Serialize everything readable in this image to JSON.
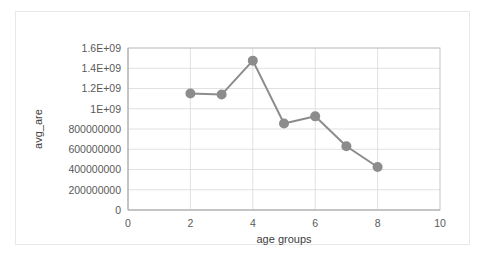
{
  "chart_data": {
    "type": "line",
    "title": "",
    "xlabel": "age groups",
    "ylabel": "avg_are",
    "x": [
      2,
      3,
      4,
      5,
      6,
      7,
      8
    ],
    "values": [
      1150000000,
      1140000000,
      1475000000,
      855000000,
      925000000,
      630000000,
      425000000
    ],
    "series": [
      {
        "name": "avg_are",
        "x": [
          2,
          3,
          4,
          5,
          6,
          7,
          8
        ],
        "values": [
          1150000000,
          1140000000,
          1475000000,
          855000000,
          925000000,
          630000000,
          425000000
        ]
      }
    ],
    "xlim": [
      0,
      10
    ],
    "ylim": [
      0,
      1600000000
    ],
    "xticks": [
      0,
      2,
      4,
      6,
      8,
      10
    ],
    "xtick_labels": [
      "0",
      "2",
      "4",
      "6",
      "8",
      "10"
    ],
    "yticks": [
      0,
      200000000,
      400000000,
      600000000,
      800000000,
      1000000000,
      1200000000,
      1400000000,
      1600000000
    ],
    "ytick_labels": [
      "0",
      "200000000",
      "400000000",
      "600000000",
      "800000000",
      "1E+09",
      "1.2E+09",
      "1.4E+09",
      "1.6E+09"
    ],
    "grid": {
      "horizontal": true,
      "vertical": true
    },
    "legend": {
      "visible": false,
      "position": "none"
    },
    "colors": {
      "series": "#8c8c8c",
      "marker": "#8c8c8c",
      "grid": "#d9d9d9",
      "axis": "#a6a6a6",
      "text": "#595959",
      "plot_border": "#bfbfbf",
      "frame_border": "#e8e8e8",
      "background": "#ffffff"
    },
    "marker": {
      "shape": "circle",
      "size": 5
    }
  }
}
